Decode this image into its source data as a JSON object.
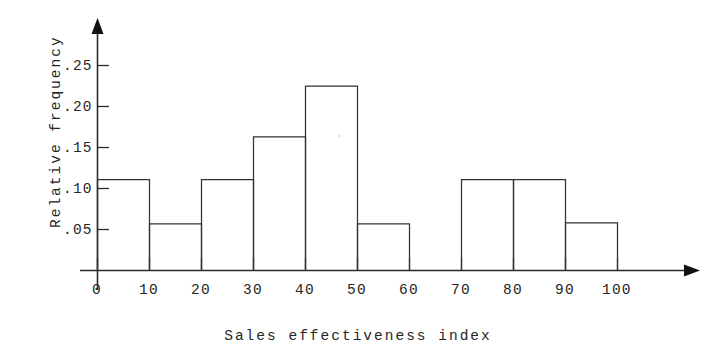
{
  "chart_data": {
    "type": "bar",
    "title": "",
    "xlabel": "Sales effectiveness index",
    "ylabel": "Relative frequency",
    "categories": [
      "0-10",
      "10-20",
      "20-30",
      "30-40",
      "40-50",
      "50-60",
      "60-70",
      "70-80",
      "80-90",
      "90-100"
    ],
    "bin_edges": [
      0,
      10,
      20,
      30,
      40,
      50,
      60,
      70,
      80,
      90,
      100
    ],
    "values": [
      0.111,
      0.057,
      0.111,
      0.163,
      0.225,
      0.057,
      0.0,
      0.111,
      0.111,
      0.058
    ],
    "xlim": [
      0,
      100
    ],
    "ylim": [
      0,
      0.27
    ],
    "x_ticks": [
      "0",
      "10",
      "20",
      "30",
      "40",
      "50",
      "60",
      "70",
      "80",
      "90",
      "100"
    ],
    "x_tick_values": [
      0,
      10,
      20,
      30,
      40,
      50,
      60,
      70,
      80,
      90,
      100
    ],
    "y_ticks": [
      ".05",
      ".10",
      ".15",
      ".20",
      ".25"
    ],
    "y_tick_values": [
      0.05,
      0.1,
      0.15,
      0.2,
      0.25
    ],
    "grid": false,
    "legend": null,
    "legend_position": "none",
    "series_color": "#333333",
    "axis_color": "#2b2b2b",
    "background_color": "#ffffff"
  },
  "axes": {
    "x_title": "Sales effectiveness index",
    "y_title": "Relative frequency"
  }
}
